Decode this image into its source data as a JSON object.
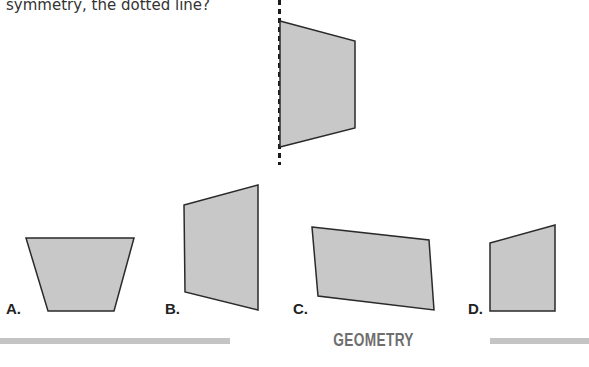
{
  "question": {
    "text": "symmetry, the dotted line?"
  },
  "figure": {
    "fill_color": "#c8c8c8",
    "stroke_color": "#2a2a2a",
    "axis_line": "dotted vertical line of symmetry",
    "reference_shape_points": "280,21 355,41 355,128 280,147"
  },
  "options": [
    {
      "label": "A.",
      "points": "26,238 134,238 114,311 48,311"
    },
    {
      "label": "B.",
      "points": "184,205 258,185 258,310 185,292"
    },
    {
      "label": "C.",
      "points": "312,227 429,240 434,310 318,296"
    },
    {
      "label": "D.",
      "points": "490,243 555,225 555,311 490,311"
    }
  ],
  "footer": {
    "section_title": "GEOMETRY"
  }
}
